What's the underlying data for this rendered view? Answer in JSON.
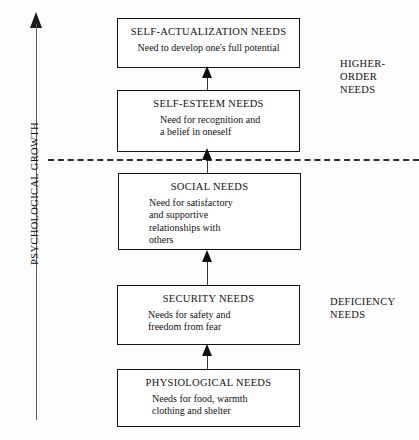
{
  "diagram": {
    "axis": {
      "label": "PSYCHOLOGICAL GROWTH",
      "arrow_direction": "up"
    },
    "divider": {
      "style": "dashed",
      "meaning": "boundary between deficiency needs and higher-order needs"
    },
    "levels": [
      {
        "id": "self-actualization",
        "title": "SELF-ACTUALIZATION NEEDS",
        "description": "Need to develop one's full potential"
      },
      {
        "id": "self-esteem",
        "title": "SELF-ESTEEM NEEDS",
        "description": "Need for recognition and\na belief in oneself"
      },
      {
        "id": "social",
        "title": "SOCIAL NEEDS",
        "description": "Need for satisfactory\nand supportive\nrelationships with\nothers"
      },
      {
        "id": "security",
        "title": "SECURITY NEEDS",
        "description": "Needs for safety and\nfreedom from fear"
      },
      {
        "id": "physiological",
        "title": "PHYSIOLOGICAL NEEDS",
        "description": "Needs for food, warmth\nclothing and shelter"
      }
    ],
    "side_labels": [
      {
        "id": "higher-order",
        "text": "HIGHER-\nORDER\nNEEDS"
      },
      {
        "id": "deficiency",
        "text": "DEFICIENCY\nNEEDS"
      }
    ],
    "caption": ""
  },
  "colors": {
    "box_border": "#141414",
    "axis": "#5a5a5a",
    "divider": "#2b2b2b",
    "text": "#111111",
    "background": "#fdfdfd"
  }
}
